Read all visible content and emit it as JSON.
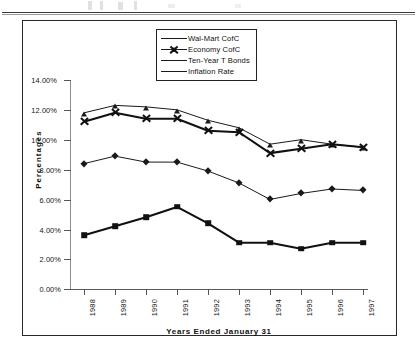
{
  "figure": {
    "frame_border_color": "#2a2a2a",
    "background": "#ffffff"
  },
  "legend": {
    "position": "top-center-inside",
    "entries": [
      {
        "label": "Wal-Mart CofC",
        "marker": "triangle-icon",
        "line": "thin"
      },
      {
        "label": "Economy CofC",
        "marker": "x-cross-icon",
        "line": "thick"
      },
      {
        "label": "Ten-Year T Bonds",
        "marker": "diamond-icon",
        "line": "thin"
      },
      {
        "label": "Inflation Rate",
        "marker": "square-icon",
        "line": "thick"
      }
    ]
  },
  "axes": {
    "y_label": "Percentages",
    "x_label": "Years Ended January 31",
    "y_ticks": [
      "0.00%",
      "2.00%",
      "4.00%",
      "6.00%",
      "8.00%",
      "10.00%",
      "12.00%",
      "14.00%"
    ],
    "x_ticks": [
      "1988",
      "1989",
      "1990",
      "1991",
      "1992",
      "1993",
      "1994",
      "1995",
      "1996",
      "1997"
    ]
  },
  "chart_data": {
    "type": "line",
    "title": "",
    "subtitle": "",
    "xlabel": "Years Ended January 31",
    "ylabel": "Percentages",
    "categories": [
      "1988",
      "1989",
      "1990",
      "1991",
      "1992",
      "1993",
      "1994",
      "1995",
      "1996",
      "1997"
    ],
    "x": [
      1988,
      1989,
      1990,
      1991,
      1992,
      1993,
      1994,
      1995,
      1996,
      1997
    ],
    "ylim": [
      0,
      14
    ],
    "yticks": [
      0,
      2,
      4,
      6,
      8,
      10,
      12,
      14
    ],
    "ytick_labels": [
      "0.00%",
      "2.00%",
      "4.00%",
      "6.00%",
      "8.00%",
      "10.00%",
      "12.00%",
      "14.00%"
    ],
    "ytick_format": "percent",
    "grid": false,
    "legend_position": "upper center",
    "series": [
      {
        "name": "Wal-Mart CofC",
        "marker": "triangle",
        "line_width": "thin",
        "color": "#1a1a1a",
        "values": [
          11.8,
          12.3,
          12.2,
          12.0,
          11.3,
          10.8,
          9.7,
          10.0,
          9.7,
          9.5
        ]
      },
      {
        "name": "Economy CofC",
        "marker": "x-cross",
        "line_width": "thick",
        "color": "#111111",
        "values": [
          11.2,
          11.8,
          11.4,
          11.4,
          10.6,
          10.5,
          9.1,
          9.4,
          9.7,
          9.5
        ]
      },
      {
        "name": "Ten-Year T Bonds",
        "marker": "diamond",
        "line_width": "thin",
        "color": "#1a1a1a",
        "values": [
          8.4,
          8.9,
          8.5,
          8.5,
          7.9,
          7.1,
          6.0,
          6.4,
          6.7,
          6.6
        ]
      },
      {
        "name": "Inflation Rate",
        "marker": "square",
        "line_width": "thick",
        "color": "#111111",
        "values": [
          3.6,
          4.2,
          4.8,
          5.5,
          4.4,
          3.1,
          3.1,
          2.7,
          3.1,
          3.1
        ]
      }
    ]
  }
}
